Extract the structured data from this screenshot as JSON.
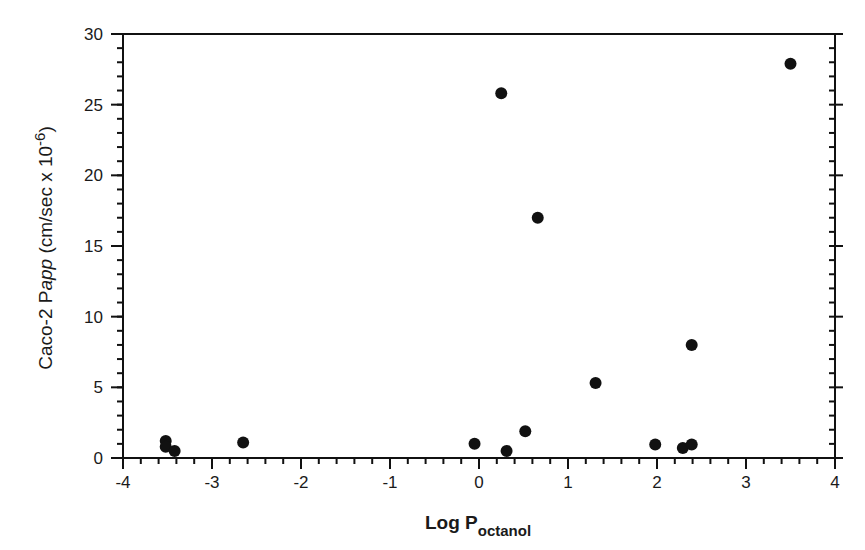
{
  "chart_data": {
    "type": "scatter",
    "title": "",
    "xlabel": "Log P",
    "xlabel_subscript": "octanol",
    "ylabel_prefix": "Caco-2 P",
    "ylabel_italic": "app",
    "ylabel_suffix": " (cm/sec x 10",
    "ylabel_exponent": "-6",
    "ylabel_close": ")",
    "xlim": [
      -4,
      4
    ],
    "ylim": [
      0,
      30
    ],
    "xticks": [
      -4,
      -3,
      -2,
      -1,
      0,
      1,
      2,
      3,
      4
    ],
    "xtick_labels": [
      "-4",
      "-3",
      "-2",
      "-1",
      "0",
      "1",
      "2",
      "3",
      "4"
    ],
    "yticks": [
      0,
      5,
      10,
      15,
      20,
      25,
      30
    ],
    "ytick_labels": [
      "0",
      "5",
      "10",
      "15",
      "20",
      "25",
      "30"
    ],
    "x_minor_step": 0.2,
    "y_minor_step": 1,
    "grid": false,
    "legend": null,
    "marker_color": "#111111",
    "series": [
      {
        "name": "compounds",
        "points": [
          {
            "x": -3.52,
            "y": 1.2
          },
          {
            "x": -3.52,
            "y": 0.8
          },
          {
            "x": -3.42,
            "y": 0.5
          },
          {
            "x": -2.65,
            "y": 1.1
          },
          {
            "x": -0.05,
            "y": 1.0
          },
          {
            "x": 0.25,
            "y": 25.8
          },
          {
            "x": 0.31,
            "y": 0.5
          },
          {
            "x": 0.52,
            "y": 1.9
          },
          {
            "x": 0.66,
            "y": 17.0
          },
          {
            "x": 1.31,
            "y": 5.3
          },
          {
            "x": 1.98,
            "y": 0.95
          },
          {
            "x": 2.29,
            "y": 0.7
          },
          {
            "x": 2.39,
            "y": 0.95
          },
          {
            "x": 2.39,
            "y": 8.0
          },
          {
            "x": 3.5,
            "y": 27.9
          }
        ]
      }
    ]
  }
}
